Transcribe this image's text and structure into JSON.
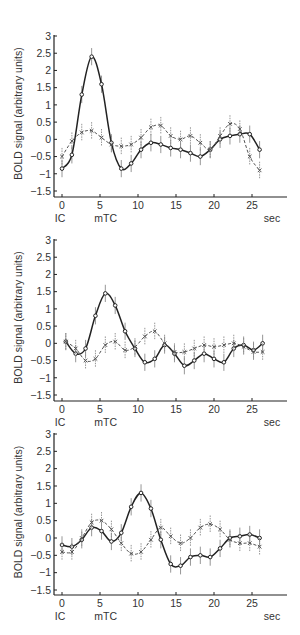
{
  "figure": {
    "ylabel": "BOLD signal (arbitrary units)",
    "x_unit_label": "sec",
    "x_annotations": [
      {
        "label": "IC",
        "x": 0
      },
      {
        "label": "mTC",
        "x": 6
      }
    ],
    "y_ticks": [
      3,
      2.5,
      2,
      1.5,
      1,
      0.5,
      0,
      -0.5,
      -1,
      -1.5
    ],
    "y_tick_labels": [
      "3",
      "2.5",
      "2",
      "1.5",
      "1",
      "0.5",
      "0",
      "−0.5",
      "−1",
      "−1.5"
    ],
    "x_ticks": [
      0,
      5,
      10,
      15,
      20,
      25
    ],
    "x_tick_labels": [
      "0",
      "5",
      "10",
      "15",
      "20",
      "25"
    ],
    "colors": {
      "solid": "#222222",
      "dashed": "#555555",
      "errorbar": "#8a8a8a",
      "axis": "#222222"
    }
  },
  "chart_data": [
    {
      "type": "line",
      "title": "",
      "xlabel": "sec",
      "ylabel": "BOLD signal (arbitrary units)",
      "xlim": [
        -1,
        29.5
      ],
      "ylim": [
        -1.6,
        3
      ],
      "grid": false,
      "annotations": [
        "IC",
        "mTC"
      ],
      "x": [
        0,
        1.3,
        2.6,
        3.9,
        5.2,
        6.5,
        7.8,
        9.1,
        10.4,
        11.7,
        13.0,
        14.3,
        15.6,
        16.9,
        18.2,
        19.5,
        20.8,
        22.1,
        23.4,
        24.7,
        26.0
      ],
      "series": [
        {
          "name": "solid",
          "style": "solid",
          "values": [
            -0.85,
            -0.45,
            1.3,
            2.4,
            1.6,
            -0.1,
            -0.85,
            -0.7,
            -0.3,
            -0.1,
            -0.15,
            -0.25,
            -0.3,
            -0.4,
            -0.5,
            -0.3,
            0.0,
            0.1,
            0.15,
            0.15,
            -0.3
          ]
        },
        {
          "name": "dashed",
          "style": "dashed",
          "values": [
            -0.5,
            -0.05,
            0.2,
            0.25,
            0.05,
            -0.15,
            -0.2,
            -0.15,
            0.05,
            0.35,
            0.4,
            0.1,
            0.0,
            0.1,
            -0.1,
            -0.3,
            0.1,
            0.45,
            0.3,
            -0.5,
            -0.9
          ]
        }
      ],
      "error_bar": 0.25
    },
    {
      "type": "line",
      "title": "",
      "xlabel": "sec",
      "ylabel": "BOLD signal (arbitrary units)",
      "xlim": [
        -1,
        29.5
      ],
      "ylim": [
        -1.6,
        3
      ],
      "grid": false,
      "annotations": [
        "IC",
        "mTC"
      ],
      "x": [
        0.5,
        1.8,
        3.1,
        4.4,
        5.7,
        7.0,
        8.3,
        9.6,
        10.9,
        12.2,
        13.5,
        14.8,
        16.1,
        17.4,
        18.7,
        20.0,
        21.3,
        22.6,
        23.9,
        25.2,
        26.4
      ],
      "series": [
        {
          "name": "solid",
          "style": "solid",
          "values": [
            0.05,
            -0.3,
            -0.15,
            0.8,
            1.45,
            1.1,
            0.35,
            -0.15,
            -0.55,
            -0.45,
            -0.05,
            -0.3,
            -0.65,
            -0.5,
            -0.3,
            -0.45,
            -0.55,
            -0.15,
            -0.05,
            -0.2,
            0.0
          ]
        },
        {
          "name": "dashed",
          "style": "dashed",
          "values": [
            0.05,
            -0.15,
            -0.5,
            -0.45,
            -0.05,
            0.05,
            -0.2,
            -0.1,
            0.2,
            0.35,
            0.0,
            -0.25,
            -0.25,
            -0.15,
            -0.05,
            -0.1,
            -0.05,
            0.0,
            -0.1,
            -0.25,
            -0.25
          ]
        }
      ],
      "error_bar": 0.25
    },
    {
      "type": "line",
      "title": "",
      "xlabel": "sec",
      "ylabel": "BOLD signal (arbitrary units)",
      "xlim": [
        -1,
        29.5
      ],
      "ylim": [
        -1.6,
        3
      ],
      "grid": false,
      "annotations": [
        "IC",
        "mTC"
      ],
      "x": [
        0,
        1.3,
        2.6,
        3.9,
        5.2,
        6.5,
        7.8,
        9.1,
        10.4,
        11.7,
        13.0,
        14.3,
        15.6,
        16.9,
        18.2,
        19.5,
        20.8,
        22.1,
        23.4,
        24.7,
        26.0
      ],
      "series": [
        {
          "name": "solid",
          "style": "solid",
          "values": [
            -0.2,
            -0.25,
            -0.05,
            0.3,
            0.2,
            -0.1,
            0.15,
            0.9,
            1.3,
            0.85,
            -0.05,
            -0.75,
            -0.8,
            -0.55,
            -0.5,
            -0.55,
            -0.3,
            0.0,
            0.05,
            0.1,
            0.0
          ]
        },
        {
          "name": "dashed",
          "style": "dashed",
          "values": [
            -0.4,
            -0.4,
            0.0,
            0.45,
            0.5,
            0.25,
            -0.15,
            -0.45,
            -0.4,
            -0.05,
            0.3,
            0.05,
            -0.15,
            0.0,
            0.3,
            0.4,
            0.25,
            -0.05,
            -0.15,
            -0.15,
            -0.25
          ]
        }
      ],
      "error_bar": 0.25
    }
  ]
}
